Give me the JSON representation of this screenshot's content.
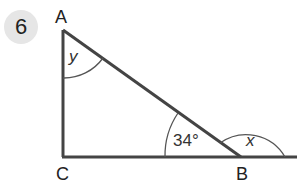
{
  "question_number": "6",
  "vertices": {
    "A": "A",
    "B": "B",
    "C": "C"
  },
  "angles": {
    "at_A": "y",
    "at_B_interior": "34°",
    "at_B_exterior": "x"
  },
  "colors": {
    "line": "#444444",
    "badge_bg": "#e6e6e6"
  }
}
